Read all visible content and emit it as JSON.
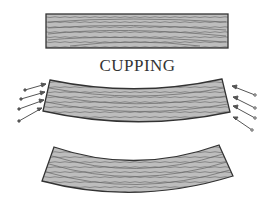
{
  "diagram": {
    "title": "CUPPING",
    "figures": [
      {
        "name": "flat-board",
        "description": "Flat board cross-section with end grain"
      },
      {
        "name": "cupping-board-with-moisture-arrows",
        "description": "Board beginning to cup with arrows indicating moisture/force at edges"
      },
      {
        "name": "cupped-board",
        "description": "Fully cupped board cross-section"
      }
    ],
    "colors": {
      "fill": "#b8b8b8",
      "outline": "#333333",
      "grain": "#6e6e6e",
      "arrow": "#555555"
    }
  }
}
